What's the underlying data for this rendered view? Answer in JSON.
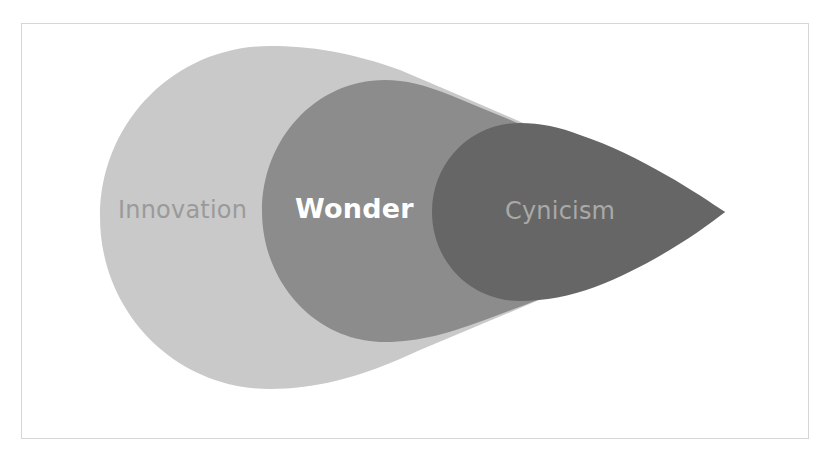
{
  "diagram": {
    "type": "nested-teardrop",
    "orientation": "pointing-right",
    "stages": [
      {
        "id": "innovation",
        "label": "Innovation",
        "fill": "#c9c9c9",
        "text_color": "#9a9a9a",
        "font_weight": "normal"
      },
      {
        "id": "wonder",
        "label": "Wonder",
        "fill": "#8c8c8c",
        "text_color": "#ffffff",
        "font_weight": "bold"
      },
      {
        "id": "cynicism",
        "label": "Cynicism",
        "fill": "#666666",
        "text_color": "#a9a9a9",
        "font_weight": "normal"
      }
    ]
  },
  "colors": {
    "background": "#ffffff",
    "frame_border": "#d6d6d6"
  }
}
